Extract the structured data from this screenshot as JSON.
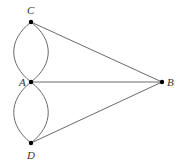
{
  "diagram": {
    "type": "graph",
    "nodes": [
      {
        "id": "C",
        "label": "C",
        "x": 31,
        "y": 22,
        "lx": 27,
        "ly": 14
      },
      {
        "id": "A",
        "label": "A",
        "x": 31,
        "y": 82,
        "lx": 19,
        "ly": 86
      },
      {
        "id": "D",
        "label": "D",
        "x": 31,
        "y": 143,
        "lx": 27,
        "ly": 159
      },
      {
        "id": "B",
        "label": "B",
        "x": 162,
        "y": 82,
        "lx": 167,
        "ly": 86
      }
    ],
    "edges": [
      {
        "from": "C",
        "to": "A",
        "kind": "curve-left"
      },
      {
        "from": "C",
        "to": "A",
        "kind": "curve-right"
      },
      {
        "from": "A",
        "to": "D",
        "kind": "curve-left"
      },
      {
        "from": "A",
        "to": "D",
        "kind": "curve-right"
      },
      {
        "from": "C",
        "to": "B",
        "kind": "straight"
      },
      {
        "from": "A",
        "to": "B",
        "kind": "straight"
      },
      {
        "from": "D",
        "to": "B",
        "kind": "straight"
      }
    ]
  }
}
